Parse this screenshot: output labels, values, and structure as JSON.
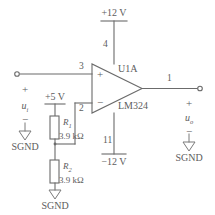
{
  "diagram": {
    "colors": {
      "wire": "#6b6b6b",
      "text": "#5d5d5d",
      "background": "#ffffff"
    }
  },
  "opamp": {
    "designator": "U1A",
    "part_number": "LM324",
    "noninverting_symbol": "+",
    "inverting_symbol": "−",
    "pins": {
      "noninverting_input": "3",
      "inverting_input": "2",
      "output": "1",
      "positive_supply": "4",
      "negative_supply": "11"
    }
  },
  "supplies": {
    "positive_rail": "+12 V",
    "negative_rail": "−12 V",
    "bias_source": "+5 V"
  },
  "resistors": [
    {
      "designator": "R",
      "subscript": "1",
      "value": "3.9 kΩ"
    },
    {
      "designator": "R",
      "subscript": "2",
      "value": "3.9 kΩ"
    }
  ],
  "input_port": {
    "plus_sign": "+",
    "minus_sign": "−",
    "signal": "u",
    "signal_subscript": "i",
    "ground_label": "SGND"
  },
  "output_port": {
    "plus_sign": "+",
    "minus_sign": "−",
    "signal": "u",
    "signal_subscript": "o",
    "ground_label": "SGND"
  },
  "divider_ground": {
    "ground_label": "SGND"
  }
}
